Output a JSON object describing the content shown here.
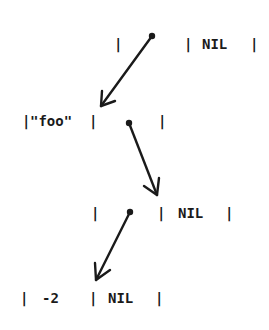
{
  "diagram": {
    "type": "linked-list-cells",
    "cells": [
      {
        "id": "cell1",
        "car_label": "",
        "cdr_label": "NIL",
        "car_is_pointer": true
      },
      {
        "id": "cell2",
        "car_label": "\"foo\"",
        "cdr_label": "",
        "cdr_is_pointer": true
      },
      {
        "id": "cell3",
        "car_label": "",
        "cdr_label": "NIL",
        "car_is_pointer": true
      },
      {
        "id": "cell4",
        "car_label": "-2",
        "cdr_label": "NIL"
      }
    ],
    "arrows": [
      {
        "from": "cell1.car",
        "to": "cell2"
      },
      {
        "from": "cell2.cdr",
        "to": "cell3"
      },
      {
        "from": "cell3.car",
        "to": "cell4"
      }
    ],
    "bar": "|",
    "text": {
      "c1_nil": "NIL",
      "c2_foo": "\"foo\"",
      "c3_nil": "NIL",
      "c4_val": "-2",
      "c4_nil": "NIL"
    },
    "colors": {
      "ink": "#1a1a1a",
      "background": "#ffffff"
    }
  }
}
